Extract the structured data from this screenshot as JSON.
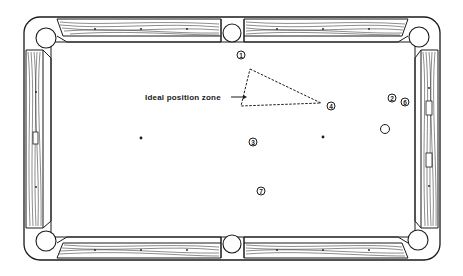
{
  "diagram": {
    "type": "pool-table-position-diagram",
    "annotation": {
      "label": "Ideal position zone",
      "arrow_target": "triangle-zone"
    },
    "zone_triangle": {
      "points": [
        [
          250,
          69
        ],
        [
          321,
          103
        ],
        [
          241,
          106
        ]
      ],
      "style": "dashed"
    },
    "balls": [
      {
        "id": "ball-1",
        "number": "1",
        "x": 241,
        "y": 55
      },
      {
        "id": "ball-4",
        "number": "4",
        "x": 331,
        "y": 106
      },
      {
        "id": "ball-2",
        "number": "2",
        "x": 392,
        "y": 98
      },
      {
        "id": "ball-6",
        "number": "6",
        "x": 405,
        "y": 102
      },
      {
        "id": "ball-3",
        "number": "3",
        "x": 253,
        "y": 142
      },
      {
        "id": "ball-7",
        "number": "7",
        "x": 261,
        "y": 191
      },
      {
        "id": "cue-ball",
        "number": "",
        "x": 385,
        "y": 129
      }
    ],
    "spots": [
      {
        "id": "head-spot",
        "x": 141,
        "y": 138
      },
      {
        "id": "foot-spot",
        "x": 323,
        "y": 137
      }
    ],
    "colors": {
      "line": "#1a1a1a",
      "background": "#ffffff",
      "rail_wood": "#ffffff"
    }
  }
}
